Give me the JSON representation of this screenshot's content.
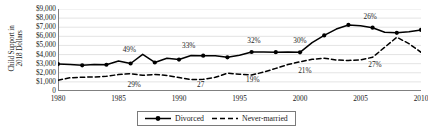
{
  "chart_data": {
    "type": "line",
    "title": "",
    "xlabel": "",
    "ylabel": "Child Support in 2018 Dollars",
    "ylabel_line1": "Child Support in",
    "ylabel_line2": "2018 Dollars",
    "xlim": [
      1980,
      2010
    ],
    "ylim": [
      0,
      9000
    ],
    "ytick_values": [
      0,
      1000,
      2000,
      3000,
      4000,
      5000,
      6000,
      7000,
      8000,
      9000
    ],
    "ytick_labels": [
      "0",
      "$1,000",
      "$2,000",
      "$3,000",
      "$4,000",
      "$5,000",
      "$6,000",
      "$7,000",
      "$8,000",
      "$9,000"
    ],
    "xtick_values": [
      1980,
      1985,
      1990,
      1995,
      2000,
      2005,
      2010
    ],
    "xtick_labels": [
      "1980",
      "1985",
      "1990",
      "1995",
      "2000",
      "2005",
      "2010"
    ],
    "grid": true,
    "legend_position": "bottom-center",
    "series": [
      {
        "name": "Divorced",
        "style": "solid",
        "marker": "circle",
        "color": "#000000",
        "x": [
          1980,
          1981,
          1982,
          1983,
          1984,
          1985,
          1986,
          1987,
          1988,
          1989,
          1990,
          1991,
          1992,
          1993,
          1994,
          1995,
          1996,
          1997,
          1998,
          1999,
          2000,
          2001,
          2002,
          2003,
          2004,
          2005,
          2006,
          2007,
          2008,
          2009,
          2010
        ],
        "values": [
          2950,
          2920,
          2820,
          2900,
          2880,
          3300,
          3020,
          4020,
          3130,
          3600,
          3450,
          3900,
          3880,
          3880,
          3700,
          3930,
          4280,
          4280,
          4260,
          4270,
          4240,
          5300,
          6100,
          6800,
          7250,
          7150,
          6950,
          6450,
          6380,
          6500,
          6700
        ]
      },
      {
        "name": "Never-married",
        "style": "dashed",
        "marker": "none",
        "color": "#000000",
        "x": [
          1980,
          1981,
          1982,
          1983,
          1984,
          1985,
          1986,
          1987,
          1988,
          1989,
          1990,
          1991,
          1992,
          1993,
          1994,
          1995,
          1996,
          1997,
          1998,
          1999,
          2000,
          2001,
          2002,
          2003,
          2004,
          2005,
          2006,
          2007,
          2008,
          2009,
          2010
        ],
        "values": [
          1180,
          1450,
          1520,
          1530,
          1620,
          1800,
          1900,
          1720,
          1820,
          1700,
          1480,
          1250,
          1280,
          1500,
          1950,
          1850,
          1750,
          2080,
          2480,
          2900,
          3200,
          3480,
          3600,
          3400,
          3350,
          3420,
          3700,
          4800,
          5900,
          5200,
          4250
        ]
      }
    ],
    "annotations": [
      {
        "text": "49%",
        "x": 1985.9,
        "y": 4450,
        "series": "Divorced"
      },
      {
        "text": "33%",
        "x": 1990.8,
        "y": 4900,
        "series": "Divorced"
      },
      {
        "text": "32%",
        "x": 1996.2,
        "y": 5450,
        "series": "Divorced"
      },
      {
        "text": "30%",
        "x": 2000.0,
        "y": 5450,
        "series": "Divorced"
      },
      {
        "text": "26%",
        "x": 2005.8,
        "y": 8100,
        "series": "Divorced"
      },
      {
        "text": "29%",
        "x": 1986.3,
        "y": 700,
        "series": "Never-married"
      },
      {
        "text": "27",
        "x": 1991.8,
        "y": 700,
        "series": "Never-married"
      },
      {
        "text": "19%",
        "x": 1996.1,
        "y": 1250,
        "series": "Never-married"
      },
      {
        "text": "21%",
        "x": 2000.4,
        "y": 2200,
        "series": "Never-married"
      },
      {
        "text": "27%",
        "x": 2006.2,
        "y": 2850,
        "series": "Never-married"
      }
    ]
  },
  "legend": {
    "items": [
      {
        "label": "Divorced",
        "style": "solid-marker"
      },
      {
        "label": "Never-married",
        "style": "dashed"
      }
    ]
  }
}
